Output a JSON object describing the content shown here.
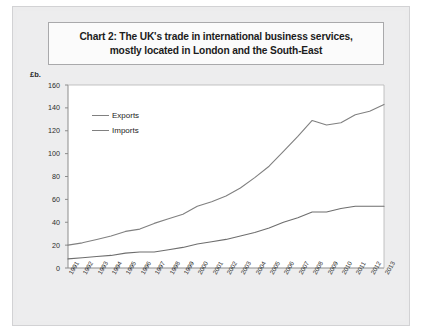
{
  "chart_data": {
    "type": "line",
    "title": "Chart 2: The UK's trade in international business services, mostly located in London and the South-East",
    "title_line1": "Chart 2: The UK's trade in international business services,",
    "title_line2": "mostly located in London and the South-East",
    "xlabel": "",
    "ylabel": "£b.",
    "ylim": [
      0,
      160
    ],
    "ytick_step": 20,
    "yticks": [
      0,
      20,
      40,
      60,
      80,
      100,
      120,
      140,
      160
    ],
    "grid": false,
    "legend_position": "top-left-inside",
    "categories": [
      "1991",
      "1992",
      "1993",
      "1994",
      "1995",
      "1996",
      "1997",
      "1998",
      "1999",
      "2000",
      "2001",
      "2002",
      "2003",
      "2004",
      "2005",
      "2006",
      "2007",
      "2008",
      "2009",
      "2010",
      "2011",
      "2012",
      "2013"
    ],
    "series": [
      {
        "name": "Exports",
        "color": "#808080",
        "values": [
          20,
          22,
          25,
          28,
          32,
          34,
          39,
          43,
          47,
          54,
          58,
          63,
          70,
          79,
          89,
          102,
          115,
          129,
          125,
          127,
          134,
          137,
          143
        ]
      },
      {
        "name": "Imports",
        "color": "#6e6e6e",
        "values": [
          8,
          9,
          10,
          11,
          13,
          14,
          14,
          16,
          18,
          21,
          23,
          25,
          28,
          31,
          35,
          40,
          44,
          49,
          49,
          52,
          54,
          54,
          54
        ]
      }
    ]
  },
  "legend": {
    "items": [
      {
        "label": "Exports"
      },
      {
        "label": "Imports"
      }
    ]
  },
  "colors": {
    "exports_line": "#808080",
    "imports_line": "#6e6e6e",
    "plot_background": "#ffffff",
    "page_background": "#ededee",
    "axis": "#808080",
    "title_border": "#a9a9ab"
  }
}
